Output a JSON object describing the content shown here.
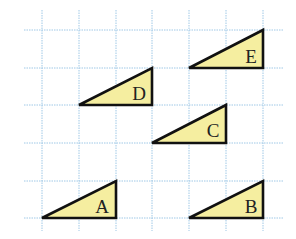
{
  "diagram": {
    "grid": {
      "x_lines": [
        42,
        79,
        116,
        152,
        189,
        226,
        263
      ],
      "y_lines": [
        30,
        68,
        105,
        143,
        181,
        218
      ],
      "x_extent": [
        24,
        284
      ],
      "y_extent": [
        10,
        231
      ],
      "color": "#9fc8e6"
    },
    "triangle_fill": "#f5eea0",
    "triangle_stroke": "#111111",
    "triangles": [
      {
        "label": "E",
        "points": "189,68 263,68 263,30",
        "label_x": 251,
        "label_y": 63
      },
      {
        "label": "D",
        "points": "79,105 152,105 152,68",
        "label_x": 139,
        "label_y": 100
      },
      {
        "label": "C",
        "points": "152,143 226,143 226,105",
        "label_x": 213,
        "label_y": 137
      },
      {
        "label": "A",
        "points": "42,218 116,218 116,181",
        "label_x": 102,
        "label_y": 213
      },
      {
        "label": "B",
        "points": "189,218 263,218 263,181",
        "label_x": 251,
        "label_y": 213
      }
    ]
  }
}
